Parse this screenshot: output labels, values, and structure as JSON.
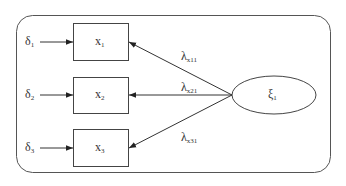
{
  "diagram": {
    "type": "measurement-model",
    "latent": {
      "symbol": "ξ",
      "subscript": "1"
    },
    "indicators": [
      {
        "symbol": "x",
        "subscript": "1",
        "error_symbol": "δ",
        "error_subscript": "1",
        "loading_symbol": "λ",
        "loading_subscript": "x11"
      },
      {
        "symbol": "x",
        "subscript": "2",
        "error_symbol": "δ",
        "error_subscript": "2",
        "loading_symbol": "λ",
        "loading_subscript": "x21"
      },
      {
        "symbol": "x",
        "subscript": "3",
        "error_symbol": "δ",
        "error_subscript": "3",
        "loading_symbol": "λ",
        "loading_subscript": "x31"
      }
    ],
    "colors": {
      "stroke": "#444444",
      "text": "#333333",
      "background": "#ffffff"
    }
  }
}
